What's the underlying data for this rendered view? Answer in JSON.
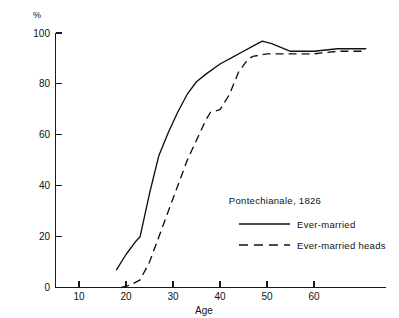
{
  "chart_data": {
    "type": "line",
    "title": "",
    "annotation": "Pontechianale, 1826",
    "xlabel": "Age",
    "ylabel": "%",
    "unit_label": "%",
    "xlim": [
      0,
      72
    ],
    "ylim": [
      0,
      100
    ],
    "grid": false,
    "legend_position": "inside-right",
    "xticks": [
      10,
      20,
      30,
      40,
      50,
      60
    ],
    "xticklabels": [
      "10",
      "20",
      "30",
      "40",
      "50",
      "60"
    ],
    "yticks": [
      0,
      20,
      40,
      60,
      80,
      100
    ],
    "yticklabels": [
      "0",
      "20",
      "40",
      "60",
      "80",
      "100"
    ],
    "series": [
      {
        "name": "Ever-married",
        "style": "solid",
        "color": "#111111",
        "x": [
          18,
          20,
          22,
          23,
          25,
          27,
          29,
          31,
          33,
          35,
          37,
          40,
          43,
          45,
          47,
          49,
          51,
          55,
          60,
          65,
          71
        ],
        "values": [
          7,
          13,
          18,
          20,
          37,
          52,
          61,
          69,
          76,
          81,
          84,
          88,
          91,
          93,
          95,
          97,
          96,
          93,
          93,
          94,
          94
        ]
      },
      {
        "name": "Ever-married heads",
        "style": "dashed",
        "color": "#111111",
        "x": [
          19,
          21,
          23,
          25,
          27,
          29,
          31,
          33,
          35,
          37,
          38,
          40,
          42,
          44,
          46,
          47,
          50,
          55,
          60,
          65,
          71
        ],
        "values": [
          0,
          1,
          3,
          10,
          20,
          30,
          40,
          50,
          58,
          66,
          69,
          70,
          76,
          85,
          90,
          91,
          92,
          92,
          92,
          93,
          93
        ]
      }
    ]
  },
  "legend": {
    "title": "Pontechianale, 1826",
    "entries": [
      {
        "label": "Ever-married",
        "style": "solid"
      },
      {
        "label": "Ever-married heads",
        "style": "dashed"
      }
    ]
  },
  "axis": {
    "x_title": "Age",
    "y_unit": "%"
  }
}
